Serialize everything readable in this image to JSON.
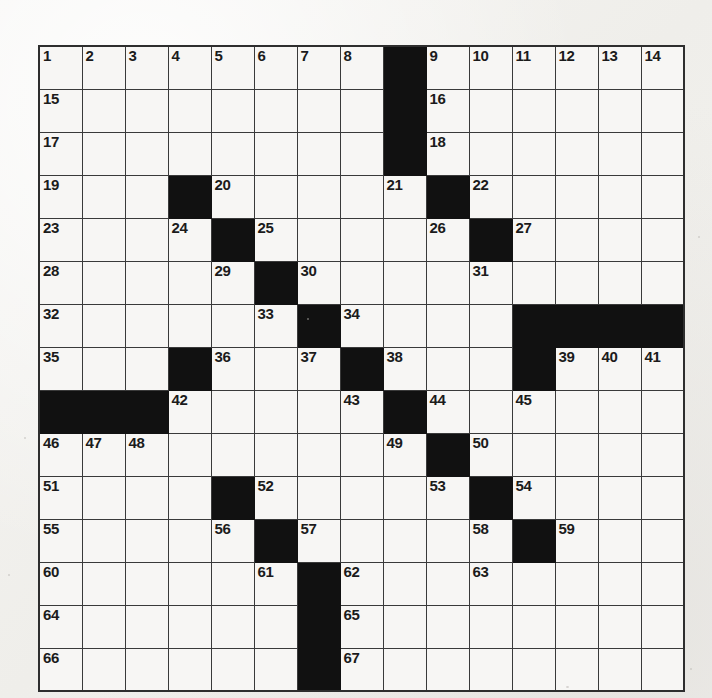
{
  "puzzle": {
    "type": "crossword-grid",
    "rows": 15,
    "cols": 15,
    "cell_size_px": 43,
    "colors": {
      "paper": "#f3f2f0",
      "cell_fill": "#f7f6f4",
      "block_fill": "#111111",
      "grid_line": "#3a3a3a",
      "number_text": "#1b1b1b"
    },
    "block_count": 31,
    "number_count": 67,
    "numbers_present": [
      1,
      2,
      3,
      4,
      5,
      6,
      7,
      8,
      9,
      10,
      11,
      12,
      13,
      14,
      15,
      16,
      17,
      18,
      19,
      20,
      21,
      22,
      23,
      24,
      25,
      26,
      27,
      28,
      29,
      30,
      31,
      32,
      33,
      34,
      35,
      36,
      37,
      38,
      39,
      40,
      41,
      42,
      43,
      44,
      45,
      46,
      47,
      48,
      49,
      50,
      51,
      52,
      53,
      54,
      55,
      56,
      57,
      58,
      59,
      60,
      61,
      62,
      63,
      64,
      65,
      66,
      67
    ],
    "grid": [
      [
        {
          "block": false,
          "number": "1"
        },
        {
          "block": false,
          "number": "2"
        },
        {
          "block": false,
          "number": "3"
        },
        {
          "block": false,
          "number": "4"
        },
        {
          "block": false,
          "number": "5"
        },
        {
          "block": false,
          "number": "6"
        },
        {
          "block": false,
          "number": "7"
        },
        {
          "block": false,
          "number": "8"
        },
        {
          "block": true,
          "number": ""
        },
        {
          "block": false,
          "number": "9"
        },
        {
          "block": false,
          "number": "10"
        },
        {
          "block": false,
          "number": "11"
        },
        {
          "block": false,
          "number": "12"
        },
        {
          "block": false,
          "number": "13"
        },
        {
          "block": false,
          "number": "14"
        }
      ],
      [
        {
          "block": false,
          "number": "15"
        },
        {
          "block": false,
          "number": ""
        },
        {
          "block": false,
          "number": ""
        },
        {
          "block": false,
          "number": ""
        },
        {
          "block": false,
          "number": ""
        },
        {
          "block": false,
          "number": ""
        },
        {
          "block": false,
          "number": ""
        },
        {
          "block": false,
          "number": ""
        },
        {
          "block": true,
          "number": ""
        },
        {
          "block": false,
          "number": "16"
        },
        {
          "block": false,
          "number": ""
        },
        {
          "block": false,
          "number": ""
        },
        {
          "block": false,
          "number": ""
        },
        {
          "block": false,
          "number": ""
        },
        {
          "block": false,
          "number": ""
        }
      ],
      [
        {
          "block": false,
          "number": "17"
        },
        {
          "block": false,
          "number": ""
        },
        {
          "block": false,
          "number": ""
        },
        {
          "block": false,
          "number": ""
        },
        {
          "block": false,
          "number": ""
        },
        {
          "block": false,
          "number": ""
        },
        {
          "block": false,
          "number": ""
        },
        {
          "block": false,
          "number": ""
        },
        {
          "block": true,
          "number": ""
        },
        {
          "block": false,
          "number": "18"
        },
        {
          "block": false,
          "number": ""
        },
        {
          "block": false,
          "number": ""
        },
        {
          "block": false,
          "number": ""
        },
        {
          "block": false,
          "number": ""
        },
        {
          "block": false,
          "number": ""
        }
      ],
      [
        {
          "block": false,
          "number": "19"
        },
        {
          "block": false,
          "number": ""
        },
        {
          "block": false,
          "number": ""
        },
        {
          "block": true,
          "number": ""
        },
        {
          "block": false,
          "number": "20"
        },
        {
          "block": false,
          "number": ""
        },
        {
          "block": false,
          "number": ""
        },
        {
          "block": false,
          "number": ""
        },
        {
          "block": false,
          "number": "21"
        },
        {
          "block": true,
          "number": ""
        },
        {
          "block": false,
          "number": "22"
        },
        {
          "block": false,
          "number": ""
        },
        {
          "block": false,
          "number": ""
        },
        {
          "block": false,
          "number": ""
        },
        {
          "block": false,
          "number": ""
        }
      ],
      [
        {
          "block": false,
          "number": "23"
        },
        {
          "block": false,
          "number": ""
        },
        {
          "block": false,
          "number": ""
        },
        {
          "block": false,
          "number": "24"
        },
        {
          "block": true,
          "number": ""
        },
        {
          "block": false,
          "number": "25"
        },
        {
          "block": false,
          "number": ""
        },
        {
          "block": false,
          "number": ""
        },
        {
          "block": false,
          "number": ""
        },
        {
          "block": false,
          "number": "26"
        },
        {
          "block": true,
          "number": ""
        },
        {
          "block": false,
          "number": "27"
        },
        {
          "block": false,
          "number": ""
        },
        {
          "block": false,
          "number": ""
        },
        {
          "block": false,
          "number": ""
        }
      ],
      [
        {
          "block": false,
          "number": "28"
        },
        {
          "block": false,
          "number": ""
        },
        {
          "block": false,
          "number": ""
        },
        {
          "block": false,
          "number": ""
        },
        {
          "block": false,
          "number": "29"
        },
        {
          "block": true,
          "number": ""
        },
        {
          "block": false,
          "number": "30"
        },
        {
          "block": false,
          "number": ""
        },
        {
          "block": false,
          "number": ""
        },
        {
          "block": false,
          "number": ""
        },
        {
          "block": false,
          "number": "31"
        },
        {
          "block": false,
          "number": ""
        },
        {
          "block": false,
          "number": ""
        },
        {
          "block": false,
          "number": ""
        },
        {
          "block": false,
          "number": ""
        }
      ],
      [
        {
          "block": false,
          "number": "32"
        },
        {
          "block": false,
          "number": ""
        },
        {
          "block": false,
          "number": ""
        },
        {
          "block": false,
          "number": ""
        },
        {
          "block": false,
          "number": ""
        },
        {
          "block": false,
          "number": "33"
        },
        {
          "block": true,
          "number": ""
        },
        {
          "block": false,
          "number": "34"
        },
        {
          "block": false,
          "number": ""
        },
        {
          "block": false,
          "number": ""
        },
        {
          "block": false,
          "number": ""
        },
        {
          "block": true,
          "number": ""
        },
        {
          "block": true,
          "number": ""
        },
        {
          "block": true,
          "number": ""
        },
        {
          "block": true,
          "number": ""
        }
      ],
      [
        {
          "block": false,
          "number": "35"
        },
        {
          "block": false,
          "number": ""
        },
        {
          "block": false,
          "number": ""
        },
        {
          "block": true,
          "number": ""
        },
        {
          "block": false,
          "number": "36"
        },
        {
          "block": false,
          "number": ""
        },
        {
          "block": false,
          "number": "37"
        },
        {
          "block": true,
          "number": ""
        },
        {
          "block": false,
          "number": "38"
        },
        {
          "block": false,
          "number": ""
        },
        {
          "block": false,
          "number": ""
        },
        {
          "block": true,
          "number": ""
        },
        {
          "block": false,
          "number": "39"
        },
        {
          "block": false,
          "number": "40"
        },
        {
          "block": false,
          "number": "41"
        }
      ],
      [
        {
          "block": true,
          "number": ""
        },
        {
          "block": true,
          "number": ""
        },
        {
          "block": true,
          "number": ""
        },
        {
          "block": false,
          "number": "42"
        },
        {
          "block": false,
          "number": ""
        },
        {
          "block": false,
          "number": ""
        },
        {
          "block": false,
          "number": ""
        },
        {
          "block": false,
          "number": "43"
        },
        {
          "block": true,
          "number": ""
        },
        {
          "block": false,
          "number": "44"
        },
        {
          "block": false,
          "number": ""
        },
        {
          "block": false,
          "number": "45"
        },
        {
          "block": false,
          "number": ""
        },
        {
          "block": false,
          "number": ""
        },
        {
          "block": false,
          "number": ""
        }
      ],
      [
        {
          "block": false,
          "number": "46"
        },
        {
          "block": false,
          "number": "47"
        },
        {
          "block": false,
          "number": "48"
        },
        {
          "block": false,
          "number": ""
        },
        {
          "block": false,
          "number": ""
        },
        {
          "block": false,
          "number": ""
        },
        {
          "block": false,
          "number": ""
        },
        {
          "block": false,
          "number": ""
        },
        {
          "block": false,
          "number": "49"
        },
        {
          "block": true,
          "number": ""
        },
        {
          "block": false,
          "number": "50"
        },
        {
          "block": false,
          "number": ""
        },
        {
          "block": false,
          "number": ""
        },
        {
          "block": false,
          "number": ""
        },
        {
          "block": false,
          "number": ""
        }
      ],
      [
        {
          "block": false,
          "number": "51"
        },
        {
          "block": false,
          "number": ""
        },
        {
          "block": false,
          "number": ""
        },
        {
          "block": false,
          "number": ""
        },
        {
          "block": true,
          "number": ""
        },
        {
          "block": false,
          "number": "52"
        },
        {
          "block": false,
          "number": ""
        },
        {
          "block": false,
          "number": ""
        },
        {
          "block": false,
          "number": ""
        },
        {
          "block": false,
          "number": "53"
        },
        {
          "block": true,
          "number": ""
        },
        {
          "block": false,
          "number": "54"
        },
        {
          "block": false,
          "number": ""
        },
        {
          "block": false,
          "number": ""
        },
        {
          "block": false,
          "number": ""
        }
      ],
      [
        {
          "block": false,
          "number": "55"
        },
        {
          "block": false,
          "number": ""
        },
        {
          "block": false,
          "number": ""
        },
        {
          "block": false,
          "number": ""
        },
        {
          "block": false,
          "number": "56"
        },
        {
          "block": true,
          "number": ""
        },
        {
          "block": false,
          "number": "57"
        },
        {
          "block": false,
          "number": ""
        },
        {
          "block": false,
          "number": ""
        },
        {
          "block": false,
          "number": ""
        },
        {
          "block": false,
          "number": "58"
        },
        {
          "block": true,
          "number": ""
        },
        {
          "block": false,
          "number": "59"
        },
        {
          "block": false,
          "number": ""
        },
        {
          "block": false,
          "number": ""
        }
      ],
      [
        {
          "block": false,
          "number": "60"
        },
        {
          "block": false,
          "number": ""
        },
        {
          "block": false,
          "number": ""
        },
        {
          "block": false,
          "number": ""
        },
        {
          "block": false,
          "number": ""
        },
        {
          "block": false,
          "number": "61"
        },
        {
          "block": true,
          "number": ""
        },
        {
          "block": false,
          "number": "62"
        },
        {
          "block": false,
          "number": ""
        },
        {
          "block": false,
          "number": ""
        },
        {
          "block": false,
          "number": "63"
        },
        {
          "block": false,
          "number": ""
        },
        {
          "block": false,
          "number": ""
        },
        {
          "block": false,
          "number": ""
        },
        {
          "block": false,
          "number": ""
        }
      ],
      [
        {
          "block": false,
          "number": "64"
        },
        {
          "block": false,
          "number": ""
        },
        {
          "block": false,
          "number": ""
        },
        {
          "block": false,
          "number": ""
        },
        {
          "block": false,
          "number": ""
        },
        {
          "block": false,
          "number": ""
        },
        {
          "block": true,
          "number": ""
        },
        {
          "block": false,
          "number": "65"
        },
        {
          "block": false,
          "number": ""
        },
        {
          "block": false,
          "number": ""
        },
        {
          "block": false,
          "number": ""
        },
        {
          "block": false,
          "number": ""
        },
        {
          "block": false,
          "number": ""
        },
        {
          "block": false,
          "number": ""
        },
        {
          "block": false,
          "number": ""
        }
      ],
      [
        {
          "block": false,
          "number": "66"
        },
        {
          "block": false,
          "number": ""
        },
        {
          "block": false,
          "number": ""
        },
        {
          "block": false,
          "number": ""
        },
        {
          "block": false,
          "number": ""
        },
        {
          "block": false,
          "number": ""
        },
        {
          "block": true,
          "number": ""
        },
        {
          "block": false,
          "number": "67"
        },
        {
          "block": false,
          "number": ""
        },
        {
          "block": false,
          "number": ""
        },
        {
          "block": false,
          "number": ""
        },
        {
          "block": false,
          "number": ""
        },
        {
          "block": false,
          "number": ""
        },
        {
          "block": false,
          "number": ""
        },
        {
          "block": false,
          "number": ""
        }
      ]
    ]
  }
}
